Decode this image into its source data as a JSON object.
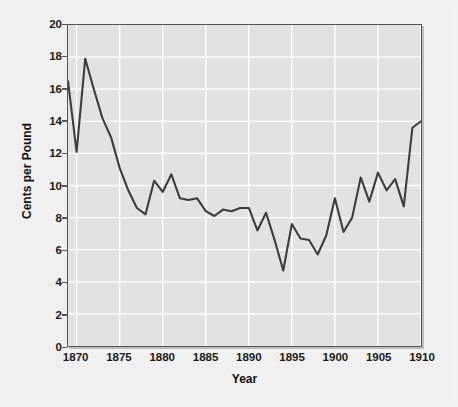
{
  "chart_data": {
    "type": "line",
    "title": "",
    "xlabel": "Year",
    "ylabel": "Cents per Pound",
    "xlim": [
      1869,
      1910
    ],
    "ylim": [
      0,
      20
    ],
    "xticks": [
      1870,
      1875,
      1880,
      1885,
      1890,
      1895,
      1900,
      1905,
      1910
    ],
    "yticks": [
      0,
      2,
      4,
      6,
      8,
      10,
      12,
      14,
      16,
      18,
      20
    ],
    "grid": true,
    "legend": "none",
    "series": [
      {
        "name": "Cotton price",
        "x": [
          1869,
          1870,
          1871,
          1872,
          1873,
          1874,
          1875,
          1876,
          1877,
          1878,
          1879,
          1880,
          1881,
          1882,
          1883,
          1884,
          1885,
          1886,
          1887,
          1888,
          1889,
          1890,
          1891,
          1892,
          1893,
          1894,
          1895,
          1896,
          1897,
          1898,
          1899,
          1900,
          1901,
          1902,
          1903,
          1904,
          1905,
          1906,
          1907,
          1908,
          1909,
          1910
        ],
        "values": [
          16.5,
          12.1,
          17.9,
          16.0,
          14.2,
          13.0,
          11.1,
          9.7,
          8.6,
          8.2,
          10.3,
          9.6,
          10.7,
          9.2,
          9.1,
          9.2,
          8.4,
          8.1,
          8.5,
          8.4,
          8.6,
          8.6,
          7.2,
          8.3,
          6.6,
          4.7,
          7.6,
          6.7,
          6.6,
          5.7,
          6.9,
          9.2,
          7.1,
          8.0,
          10.5,
          9.0,
          10.8,
          9.7,
          10.4,
          8.7,
          13.6,
          14.0
        ]
      }
    ],
    "line_color": "#3d3d3d",
    "plot_bg": "#e2e2e2",
    "grid_color": "#ffffff",
    "figure_bg": "#f0f0f0"
  },
  "axes": {
    "ylabel_text": "Cents per Pound",
    "xlabel_text": "Year"
  }
}
